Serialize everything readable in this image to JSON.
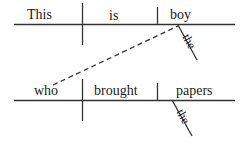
{
  "diagram": {
    "type": "reed-kellogg-sentence-diagram",
    "sentence": "This is the boy who brought the papers",
    "ink_color": "#333333",
    "text_color": "#1a1a1a",
    "background_color": "#ffffff",
    "clauses": [
      {
        "id": "main-clause",
        "baseline": {
          "x1": 14,
          "y1": 24,
          "x2": 235,
          "y2": 24
        },
        "slots": [
          {
            "role": "subject",
            "text": "This"
          },
          {
            "role": "linking-verb",
            "text": "is"
          },
          {
            "role": "predicate-nominative",
            "text": "boy"
          }
        ],
        "modifiers": [
          {
            "role": "article",
            "text": "the",
            "modifies": "boy"
          }
        ],
        "dividers": [
          {
            "kind": "subject-verb-divider",
            "x": 82,
            "y_top": 3,
            "y_bottom": 45
          },
          {
            "kind": "predicate-nominative-divider",
            "x": 157,
            "y_top": 7,
            "y_bottom": 24
          }
        ]
      },
      {
        "id": "relative-clause",
        "baseline": {
          "x1": 14,
          "y1": 100,
          "x2": 235,
          "y2": 100
        },
        "slots": [
          {
            "role": "relative-pronoun-subject",
            "text": "who"
          },
          {
            "role": "transitive-verb",
            "text": "brought"
          },
          {
            "role": "direct-object",
            "text": "papers"
          }
        ],
        "modifiers": [
          {
            "role": "article",
            "text": "the",
            "modifies": "papers"
          }
        ],
        "dividers": [
          {
            "kind": "subject-verb-divider",
            "x": 82,
            "y_top": 79,
            "y_bottom": 121
          },
          {
            "kind": "direct-object-divider",
            "x": 157,
            "y_top": 83,
            "y_bottom": 100
          }
        ]
      }
    ],
    "connector": {
      "kind": "dashed-relative-clause-connector",
      "from": {
        "x": 53,
        "y": 85,
        "anchor": "who"
      },
      "to": {
        "x": 178,
        "y": 26,
        "anchor": "boy"
      },
      "style": "dashed"
    },
    "modifier_lines": [
      {
        "for": "the-boy",
        "x1": 178,
        "y1": 25,
        "x2": 197,
        "y2": 60
      },
      {
        "for": "the-papers",
        "x1": 172,
        "y1": 100,
        "x2": 192,
        "y2": 136
      }
    ]
  }
}
